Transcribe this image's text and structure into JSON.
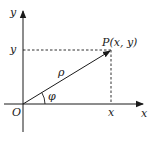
{
  "diagram": {
    "axes": {
      "x_label": "x",
      "y_label": "y",
      "origin_label": "O"
    },
    "point": {
      "label": "P(x, y)"
    },
    "projections": {
      "x_tick_label": "x",
      "y_tick_label": "y"
    },
    "radius_label": "ρ",
    "angle_label": "φ",
    "colors": {
      "stroke": "#1a1a1a",
      "background": "#ffffff"
    }
  }
}
